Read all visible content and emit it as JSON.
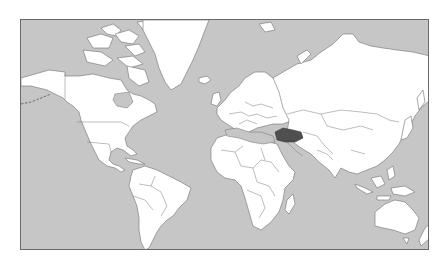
{
  "map": {
    "projection": "mercator",
    "highlighted_country": "Turkey",
    "colors": {
      "ocean": "#c6c6c6",
      "land": "#ffffff",
      "borders": "#6e6e6e",
      "highlight": "#4f4f4f",
      "frame": "#6a6a6a"
    }
  }
}
